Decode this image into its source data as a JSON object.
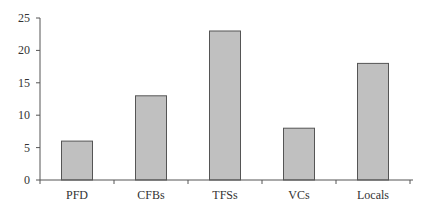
{
  "chart_data": {
    "type": "bar",
    "title": "",
    "xlabel": "",
    "ylabel": "",
    "categories": [
      "PFD",
      "CFBs",
      "TFSs",
      "VCs",
      "Locals"
    ],
    "values": [
      6,
      13,
      23,
      8,
      18
    ],
    "ylim": [
      0,
      25
    ],
    "yticks": [
      0,
      5,
      10,
      15,
      20,
      25
    ],
    "grid": false,
    "legend": null,
    "colors": {
      "bar_fill": "#c0c0c0",
      "bar_stroke": "#555555",
      "axis": "#555555"
    }
  }
}
